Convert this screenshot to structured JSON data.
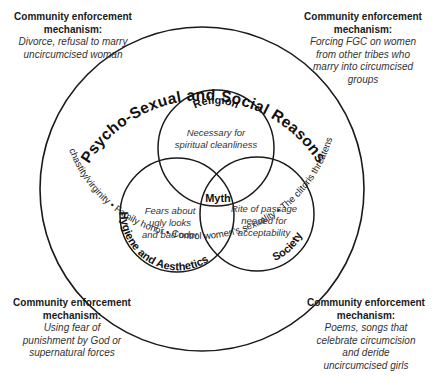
{
  "mechanisms": {
    "top_left": {
      "heading": "Community enforcement mechanism:",
      "lines": [
        "Divorce, refusal to marry",
        "uncircumcised woman"
      ]
    },
    "top_right": {
      "heading": "Community enforcement mechanism:",
      "lines": [
        "Forcing FGC on women",
        "from other tribes who",
        "marry into circumcised",
        "groups"
      ]
    },
    "bottom_left": {
      "heading": "Community enforcement mechanism:",
      "lines": [
        "Using fear of",
        "punishment by God or",
        "supernatural forces"
      ]
    },
    "bottom_right": {
      "heading": "Community enforcement mechanism:",
      "lines": [
        "Poems, songs that",
        "celebrate circumcision",
        "and deride",
        "uncircumcised girls"
      ]
    }
  },
  "outer_circle": {
    "title": "Psycho-Sexual and Social Reasons",
    "bottom_arc_text": "Maintain chastity/virginity • Family honor • Control women's sexuality • The clitoris threatens the penis"
  },
  "venn": {
    "religion": {
      "label": "Religion",
      "desc": [
        "Necessary for",
        "spiritual cleanliness"
      ]
    },
    "hygiene": {
      "label": "Hygiene and Aesthetics",
      "desc": [
        "Fears about",
        "ugly looks",
        "and bad odor"
      ]
    },
    "society": {
      "label": "Society",
      "desc": [
        "Rite of passage",
        "needed for",
        "acceptability"
      ]
    },
    "center": {
      "label": "Myth"
    }
  },
  "colors": {
    "stroke": "#1a1a1a",
    "background": "#ffffff"
  }
}
